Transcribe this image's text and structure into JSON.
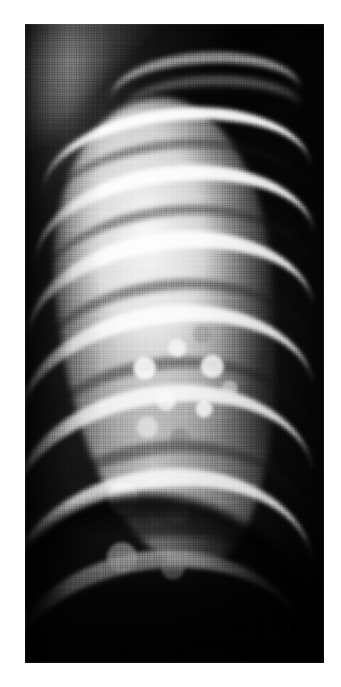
{
  "figure": {
    "kind": "radiograph",
    "modality": "X-ray",
    "body_region": "chest",
    "view": "frontal, single hemithorax (cropped)",
    "color_mode": "grayscale",
    "caption": "",
    "visible_text": "",
    "border": {
      "present": true,
      "color": "#ffffff",
      "left_px": 25,
      "top_px": 24,
      "right_px": 17,
      "bottom_px": 24
    },
    "canvas": {
      "width_px": 341,
      "height_px": 687,
      "film_x": 25,
      "film_y": 24,
      "film_width": 299,
      "film_height": 639
    },
    "texture": {
      "halftone_screen": true,
      "film_grain": true,
      "description": "fine printed halftone grid visible across the whole plate"
    },
    "palette": {
      "paper_white": "#ffffff",
      "bone_bright": "#f5f5f5",
      "lung_field": "#e8e8e8",
      "soft_tissue": "#8a8a8a",
      "intercostal": "#4a4a4a",
      "background_dark": "#141414",
      "deep_black": "#0a0a0a"
    },
    "anatomy": [
      {
        "name": "clavicle",
        "label": "clavicle",
        "region": "apex",
        "density": "bright"
      },
      {
        "name": "lung-field",
        "label": "aerated lung field",
        "region": "central",
        "density": "bright"
      },
      {
        "name": "rib-cage",
        "label": "posterior and anterior ribs",
        "region": "lateral",
        "density": "bright-bands"
      },
      {
        "name": "intercostal-spaces",
        "label": "intercostal spaces",
        "region": "lateral",
        "density": "dark-bands"
      },
      {
        "name": "pulmonary-infiltrate",
        "label": "mottled nodular opacity",
        "region": "perihilar / mid-zone",
        "density": "mottled"
      },
      {
        "name": "diaphragm",
        "label": "hemidiaphragm",
        "region": "base",
        "density": "dark curve"
      },
      {
        "name": "mediastinum",
        "label": "mediastinal border",
        "region": "medial right",
        "density": "dense dark"
      },
      {
        "name": "shoulder-soft-tissue",
        "label": "shoulder soft tissue",
        "region": "upper left",
        "density": "bright"
      }
    ],
    "ribs": {
      "count_visible": 9,
      "orientation": "running infero-laterally from upper-right to lower-left",
      "bands": [
        {
          "top": 34,
          "left": 28,
          "width": 268,
          "height": 128,
          "thickness": 13,
          "rotate": -6,
          "bright": true
        },
        {
          "top": 66,
          "left": 22,
          "width": 276,
          "height": 140,
          "thickness": 9,
          "rotate": -6,
          "bright": false
        },
        {
          "top": 92,
          "left": 20,
          "width": 280,
          "height": 150,
          "thickness": 16,
          "rotate": -7,
          "bright": true
        },
        {
          "top": 132,
          "left": 16,
          "width": 284,
          "height": 158,
          "thickness": 10,
          "rotate": -7,
          "bright": false
        },
        {
          "top": 158,
          "left": 12,
          "width": 288,
          "height": 168,
          "thickness": 18,
          "rotate": -8,
          "bright": true
        },
        {
          "top": 206,
          "left": 8,
          "width": 292,
          "height": 176,
          "thickness": 11,
          "rotate": -8,
          "bright": false
        },
        {
          "top": 232,
          "left": 4,
          "width": 296,
          "height": 184,
          "thickness": 18,
          "rotate": -9,
          "bright": true
        },
        {
          "top": 284,
          "left": 0,
          "width": 300,
          "height": 192,
          "thickness": 12,
          "rotate": -9,
          "bright": false
        },
        {
          "top": 312,
          "left": -4,
          "width": 304,
          "height": 200,
          "thickness": 18,
          "rotate": -10,
          "bright": true
        },
        {
          "top": 368,
          "left": -8,
          "width": 308,
          "height": 208,
          "thickness": 13,
          "rotate": -10,
          "bright": false
        },
        {
          "top": 396,
          "left": -12,
          "width": 312,
          "height": 216,
          "thickness": 19,
          "rotate": -11,
          "bright": true
        },
        {
          "top": 452,
          "left": -16,
          "width": 314,
          "height": 222,
          "thickness": 13,
          "rotate": -11,
          "bright": false
        },
        {
          "top": 478,
          "left": -20,
          "width": 316,
          "height": 228,
          "thickness": 18,
          "rotate": -12,
          "bright": true
        }
      ]
    }
  }
}
